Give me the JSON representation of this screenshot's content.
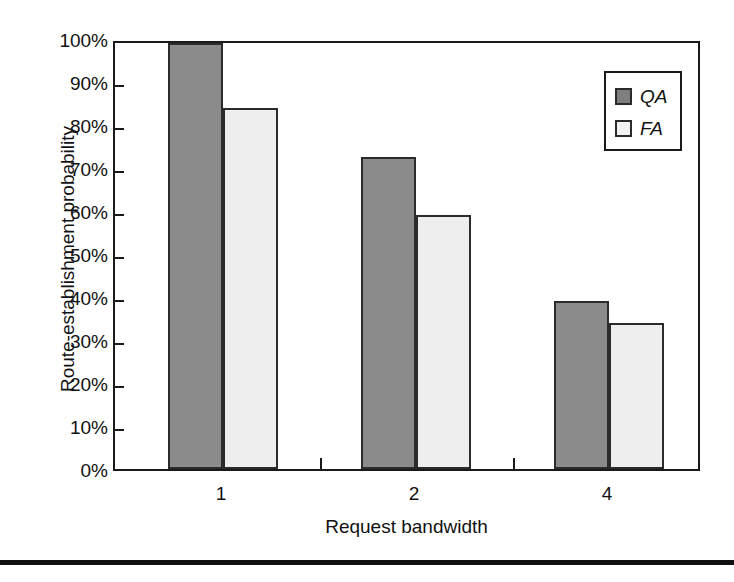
{
  "chart_data": {
    "type": "bar",
    "title": "",
    "xlabel": "Request bandwidth",
    "ylabel": "Route-establishment probability",
    "categories": [
      "1",
      "2",
      "4"
    ],
    "series": [
      {
        "name": "QA",
        "values": [
          99,
          72.5,
          39
        ],
        "color": "#8b8b8b"
      },
      {
        "name": "FA",
        "values": [
          84,
          59,
          34
        ],
        "color": "#eeeeee"
      }
    ],
    "ylim": [
      0,
      100
    ],
    "ytick_labels": [
      "100%",
      "90%",
      "80%",
      "70%",
      "60%",
      "50%",
      "40%",
      "30%",
      "20%",
      "10%",
      "0%"
    ],
    "ytick_values": [
      100,
      90,
      80,
      70,
      60,
      50,
      40,
      30,
      20,
      10,
      0
    ],
    "grid": false,
    "legend_position": "top-right",
    "legend_entries": [
      {
        "label": "QA",
        "swatch": "dark-gray"
      },
      {
        "label": "FA",
        "swatch": "light-gray"
      }
    ]
  },
  "colors": {
    "qa_fill": "#8b8b8b",
    "fa_fill": "#eeeeee",
    "outline": "#2b2b2b",
    "axis": "#1a1a1a",
    "text": "#111111"
  }
}
